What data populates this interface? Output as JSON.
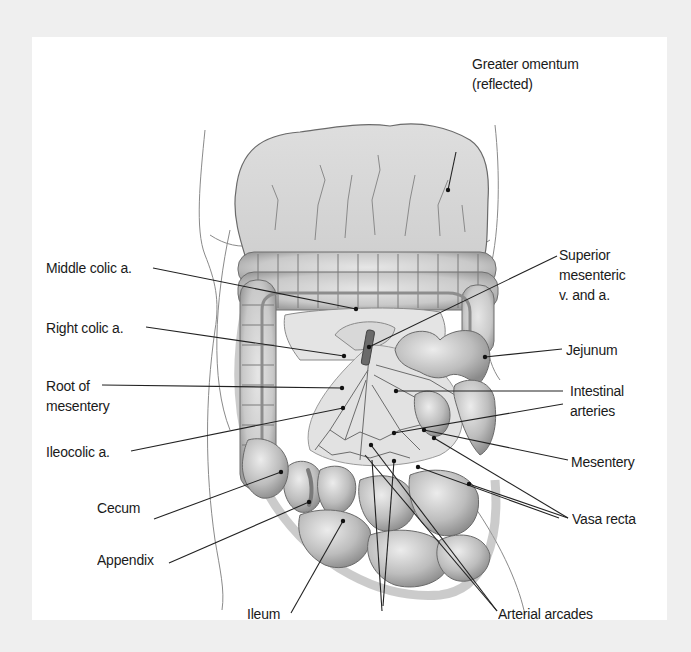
{
  "figure": {
    "colors": {
      "page_background": "#efefef",
      "panel_background": "#ffffff",
      "label_text": "#1a1a1a",
      "leader_line": "#222222",
      "tissue_fill": "#cfcfcf",
      "tissue_shadow": "#9a9a9a"
    }
  },
  "labels": {
    "greater_omentum": "Greater omentum\n(reflected)",
    "middle_colic": "Middle colic a.",
    "right_colic": "Right colic a.",
    "root_of_mesentery": "Root of\nmesentery",
    "ileocolic": "Ileocolic a.",
    "cecum": "Cecum",
    "appendix": "Appendix",
    "ileum": "Ileum",
    "superior_mesenteric": "Superior\nmesenteric\nv. and a.",
    "jejunum": "Jejunum",
    "intestinal_arteries": "Intestinal\narteries",
    "mesentery": "Mesentery",
    "vasa_recta": "Vasa recta",
    "arterial_arcades": "Arterial arcades"
  }
}
